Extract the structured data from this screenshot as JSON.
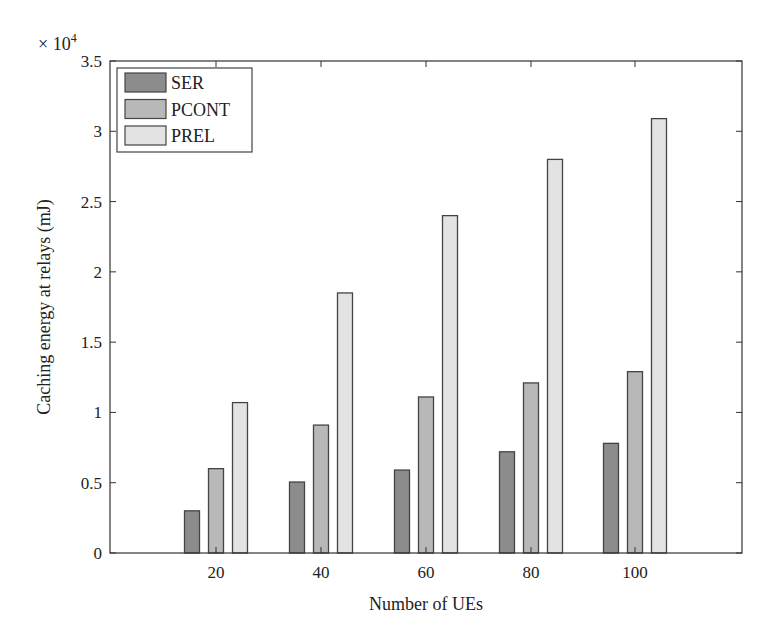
{
  "chart_data": {
    "type": "bar",
    "title": "",
    "xlabel": "Number of UEs",
    "ylabel": "Caching energy at relays (mJ)",
    "y_multiplier": "× 10^4",
    "ylim": [
      0,
      3.5
    ],
    "yticks": [
      "0",
      "0.5",
      "1",
      "1.5",
      "2",
      "2.5",
      "3",
      "3.5"
    ],
    "categories": [
      "20",
      "40",
      "60",
      "80",
      "100"
    ],
    "grid": false,
    "legend_position": "top-left",
    "series": [
      {
        "name": "SER",
        "color": "#8c8c8c",
        "values": [
          0.3,
          0.505,
          0.59,
          0.72,
          0.78
        ]
      },
      {
        "name": "PCONT",
        "color": "#b8b8b8",
        "values": [
          0.6,
          0.91,
          1.11,
          1.21,
          1.29
        ]
      },
      {
        "name": "PREL",
        "color": "#e3e3e3",
        "values": [
          1.07,
          1.85,
          2.4,
          2.8,
          3.09
        ]
      }
    ]
  },
  "labels": {
    "xlabel": "Number of UEs",
    "ylabel": "Caching energy at relays (mJ)",
    "multiplier_base": "× 10",
    "multiplier_exp": "4"
  }
}
